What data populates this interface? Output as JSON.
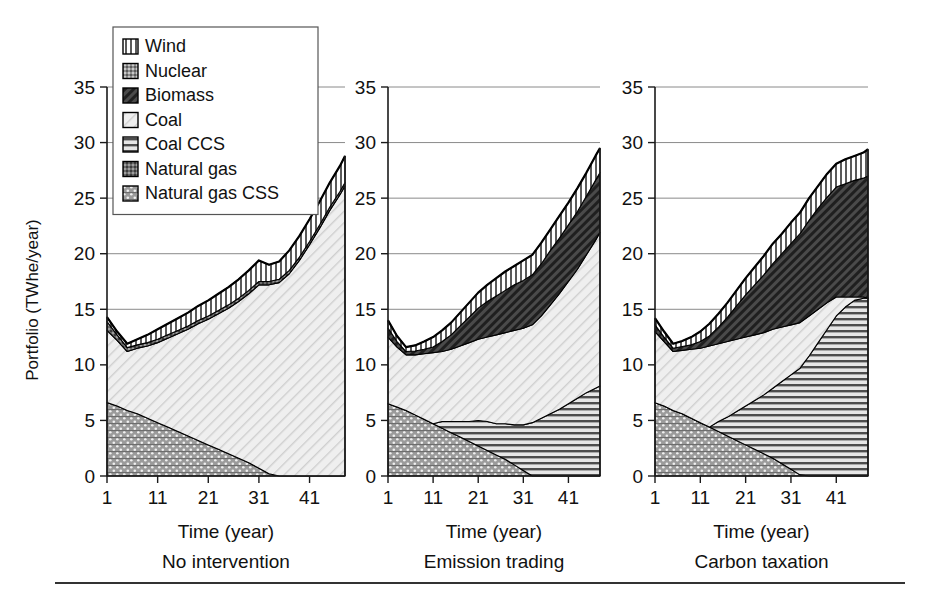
{
  "figure": {
    "y_axis_label": "Portfolio (TWhe/year)",
    "x_axis_label": "Time (year)",
    "y_ticks": [
      "0",
      "5",
      "10",
      "15",
      "20",
      "25",
      "30",
      "35"
    ],
    "x_ticks": [
      "1",
      "11",
      "21",
      "31",
      "41"
    ]
  },
  "legend": {
    "title": "",
    "items": [
      {
        "label": "Wind",
        "pattern": "vertical-stripes",
        "color": "#f2f2f2"
      },
      {
        "label": "Nuclear",
        "pattern": "speckle-cross",
        "color": "#9a9a9a"
      },
      {
        "label": "Biomass",
        "pattern": "dense-diagonal",
        "color": "#4d4d4d"
      },
      {
        "label": "Coal",
        "pattern": "light-diagonal",
        "color": "#ececec"
      },
      {
        "label": "Coal CCS",
        "pattern": "horizontal-lines",
        "color": "#d8d8d8"
      },
      {
        "label": "Natural gas",
        "pattern": "dark-speckle",
        "color": "#707070"
      },
      {
        "label": "Natural gas CSS",
        "pattern": "dot-cross",
        "color": "#a8a8a8"
      }
    ]
  },
  "chart_data": [
    {
      "type": "area",
      "title": "No intervention",
      "xlabel": "Time (year)",
      "ylabel": "Portfolio (TWhe/year)",
      "xlim": [
        1,
        48
      ],
      "ylim": [
        0,
        35
      ],
      "grid": true,
      "legend_position": "top-left-overlay",
      "stack_order_bottom_to_top": [
        "Natural gas CSS",
        "Coal",
        "Natural gas",
        "Wind"
      ],
      "x": [
        1,
        3,
        5,
        7,
        9,
        11,
        13,
        15,
        17,
        19,
        21,
        23,
        25,
        27,
        29,
        31,
        33,
        35,
        37,
        39,
        41,
        43,
        45,
        47,
        48
      ],
      "series": [
        {
          "name": "Natural gas CSS",
          "values": [
            6.6,
            6.3,
            5.9,
            5.6,
            5.2,
            4.8,
            4.4,
            4.0,
            3.6,
            3.2,
            2.8,
            2.4,
            2.0,
            1.6,
            1.2,
            0.7,
            0.2,
            0.0,
            0.0,
            0.0,
            0.0,
            0.0,
            0.0,
            0.0,
            0.0
          ]
        },
        {
          "name": "Coal",
          "values": [
            6.5,
            5.9,
            5.3,
            5.9,
            6.5,
            7.2,
            8.0,
            8.8,
            9.6,
            10.5,
            11.3,
            12.2,
            13.1,
            14.1,
            15.2,
            16.5,
            17.0,
            17.4,
            18.2,
            19.4,
            20.8,
            22.3,
            23.9,
            25.3,
            26.1
          ]
        },
        {
          "name": "Natural gas",
          "values": [
            0.8,
            0.5,
            0.35,
            0.3,
            0.3,
            0.3,
            0.3,
            0.3,
            0.3,
            0.3,
            0.3,
            0.3,
            0.3,
            0.3,
            0.3,
            0.3,
            0.3,
            0.3,
            0.3,
            0.3,
            0.3,
            0.3,
            0.3,
            0.3,
            0.3
          ]
        },
        {
          "name": "Wind",
          "values": [
            0.4,
            0.3,
            0.35,
            0.5,
            0.7,
            0.9,
            1.0,
            1.1,
            1.2,
            1.3,
            1.4,
            1.5,
            1.6,
            1.7,
            1.8,
            1.9,
            1.5,
            1.6,
            1.8,
            1.9,
            2.0,
            2.1,
            2.2,
            2.3,
            2.4
          ]
        }
      ]
    },
    {
      "type": "area",
      "title": "Emission trading",
      "xlabel": "Time (year)",
      "ylabel": "Portfolio (TWhe/year)",
      "xlim": [
        1,
        48
      ],
      "ylim": [
        0,
        35
      ],
      "grid": true,
      "legend_position": "shared",
      "stack_order_bottom_to_top": [
        "Natural gas CSS",
        "Coal CCS",
        "Coal",
        "Biomass",
        "Wind"
      ],
      "x": [
        1,
        3,
        5,
        7,
        9,
        11,
        13,
        15,
        17,
        19,
        21,
        23,
        25,
        27,
        29,
        31,
        33,
        35,
        37,
        39,
        41,
        43,
        45,
        47,
        48
      ],
      "series": [
        {
          "name": "Natural gas CSS",
          "values": [
            6.5,
            6.2,
            5.9,
            5.5,
            5.1,
            4.7,
            4.3,
            3.9,
            3.5,
            3.1,
            2.7,
            2.3,
            1.9,
            1.5,
            1.0,
            0.5,
            0.0,
            0.0,
            0.0,
            0.0,
            0.0,
            0.0,
            0.0,
            0.0,
            0.0
          ]
        },
        {
          "name": "Coal CCS",
          "values": [
            0.0,
            0.0,
            0.0,
            0.0,
            0.0,
            0.0,
            0.6,
            1.0,
            1.4,
            1.8,
            2.3,
            2.6,
            2.8,
            3.2,
            3.6,
            4.1,
            4.8,
            5.2,
            5.6,
            6.0,
            6.5,
            7.0,
            7.5,
            7.9,
            8.1
          ]
        },
        {
          "name": "Coal",
          "values": [
            6.0,
            5.4,
            5.0,
            5.4,
            5.9,
            6.4,
            6.3,
            6.5,
            6.8,
            7.1,
            7.3,
            7.6,
            8.0,
            8.2,
            8.5,
            8.7,
            8.8,
            9.2,
            9.8,
            10.4,
            11.0,
            11.6,
            12.4,
            13.3,
            13.8
          ]
        },
        {
          "name": "Biomass",
          "values": [
            0.8,
            0.5,
            0.3,
            0.35,
            0.4,
            0.5,
            0.9,
            1.3,
            1.8,
            2.3,
            2.8,
            3.2,
            3.5,
            3.8,
            4.1,
            4.3,
            4.5,
            4.7,
            4.9,
            5.0,
            5.1,
            5.2,
            5.3,
            5.4,
            5.4
          ]
        },
        {
          "name": "Wind",
          "values": [
            0.7,
            0.5,
            0.4,
            0.5,
            0.7,
            0.9,
            1.0,
            1.1,
            1.2,
            1.3,
            1.4,
            1.5,
            1.6,
            1.7,
            1.7,
            1.8,
            1.8,
            1.9,
            1.9,
            2.0,
            2.0,
            2.1,
            2.1,
            2.2,
            2.2
          ]
        }
      ]
    },
    {
      "type": "area",
      "title": "Carbon taxation",
      "xlabel": "Time (year)",
      "ylabel": "Portfolio (TWhe/year)",
      "xlim": [
        1,
        48
      ],
      "ylim": [
        0,
        35
      ],
      "grid": true,
      "legend_position": "shared",
      "stack_order_bottom_to_top": [
        "Natural gas CSS",
        "Coal CCS",
        "Coal",
        "Biomass",
        "Wind"
      ],
      "x": [
        1,
        3,
        5,
        7,
        9,
        11,
        13,
        15,
        17,
        19,
        21,
        23,
        25,
        27,
        29,
        31,
        33,
        35,
        37,
        39,
        41,
        43,
        45,
        47,
        48
      ],
      "series": [
        {
          "name": "Natural gas CSS",
          "values": [
            6.6,
            6.3,
            5.9,
            5.6,
            5.2,
            4.8,
            4.4,
            4.0,
            3.6,
            3.2,
            2.8,
            2.4,
            2.0,
            1.6,
            1.1,
            0.6,
            0.1,
            0.0,
            0.0,
            0.0,
            0.0,
            0.0,
            0.0,
            0.0,
            0.0
          ]
        },
        {
          "name": "Coal CCS",
          "values": [
            0.0,
            0.0,
            0.0,
            0.0,
            0.0,
            0.0,
            0.0,
            0.9,
            1.7,
            2.6,
            3.5,
            4.4,
            5.3,
            6.3,
            7.4,
            8.5,
            9.6,
            10.8,
            12.0,
            13.2,
            14.4,
            15.2,
            15.8,
            16.0,
            16.0
          ]
        },
        {
          "name": "Coal",
          "values": [
            6.4,
            5.8,
            5.3,
            5.7,
            6.2,
            6.7,
            7.3,
            7.0,
            6.8,
            6.5,
            6.2,
            5.9,
            5.6,
            5.3,
            4.9,
            4.5,
            4.1,
            3.6,
            3.0,
            2.4,
            1.7,
            0.9,
            0.3,
            0.1,
            0.0
          ]
        },
        {
          "name": "Biomass",
          "values": [
            0.6,
            0.4,
            0.3,
            0.35,
            0.4,
            0.6,
            0.9,
            1.5,
            2.2,
            3.0,
            3.8,
            4.5,
            5.2,
            5.9,
            6.6,
            7.3,
            8.0,
            8.6,
            9.1,
            9.5,
            9.9,
            10.2,
            10.5,
            10.7,
            11.0
          ]
        },
        {
          "name": "Wind",
          "values": [
            0.6,
            0.5,
            0.4,
            0.5,
            0.7,
            0.9,
            1.1,
            1.2,
            1.3,
            1.4,
            1.5,
            1.6,
            1.7,
            1.8,
            1.8,
            1.9,
            1.9,
            2.0,
            2.0,
            2.1,
            2.1,
            2.2,
            2.2,
            2.3,
            2.4
          ]
        }
      ]
    }
  ]
}
